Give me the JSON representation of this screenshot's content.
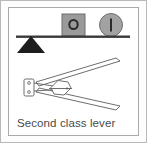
{
  "figure": {
    "caption": "Second class lever",
    "title_text": "Second class lever",
    "frame": {
      "outer_border_color": "#b9b9b9",
      "inner_border_color": "#aaaaaa",
      "background_color": "#ffffff"
    },
    "lever_diagram": {
      "name": "seesaw-lever",
      "beam": {
        "label": "lever-beam",
        "color": "#3a3a3a"
      },
      "fulcrum": {
        "label": "triangle-fulcrum",
        "shape": "triangle",
        "color": "#1d1d1d",
        "position": "left-end"
      },
      "loads": [
        {
          "label": "O",
          "shape": "square",
          "name": "square-weight",
          "fill_color": "#9a9a9a",
          "stroke_color": "#6f6f6f",
          "mark_color": "#2b2b2b"
        },
        {
          "label": "I",
          "shape": "circle",
          "name": "circle-weight",
          "fill_color": "#a2a2a2",
          "stroke_color": "#6f6f6f",
          "mark_color": "#2b2b2b"
        }
      ]
    },
    "tool_diagram": {
      "name": "nutcracker",
      "parts": [
        {
          "label": "hinge-plate",
          "name": "hinge-plate"
        },
        {
          "label": "rivet",
          "name": "hinge-rivet-top"
        },
        {
          "label": "rivet",
          "name": "hinge-rivet-bottom"
        },
        {
          "label": "upper-handle",
          "name": "upper-handle-arm"
        },
        {
          "label": "lower-handle",
          "name": "lower-handle-arm"
        },
        {
          "label": "nut",
          "name": "nut-shape"
        }
      ],
      "line_color": "#5e5e5e"
    }
  }
}
